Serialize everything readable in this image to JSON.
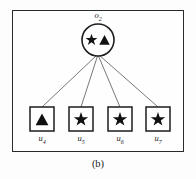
{
  "figure": {
    "caption": "(b)",
    "frame": {
      "visible": true,
      "stroke": "#2a2a2a"
    },
    "colors": {
      "stroke": "#2a2a2a",
      "edge": "#555555",
      "glyph_fill": "#111111",
      "background": "#fefefe"
    },
    "root": {
      "shape": "circle",
      "label_text": "o",
      "label_sub": "2",
      "center_x": 98,
      "center_y": 40,
      "radius": 16,
      "glyphs": [
        {
          "name": "star-glyph",
          "type": "star"
        },
        {
          "name": "triangle-glyph",
          "type": "triangle"
        }
      ]
    },
    "leaves": [
      {
        "label_text": "u",
        "label_sub": "4",
        "shape": "square",
        "glyph": "triangle",
        "x": 30,
        "y": 107,
        "size": 24
      },
      {
        "label_text": "u",
        "label_sub": "5",
        "shape": "square",
        "glyph": "star",
        "x": 69,
        "y": 107,
        "size": 24
      },
      {
        "label_text": "u",
        "label_sub": "6",
        "shape": "square",
        "glyph": "star",
        "x": 108,
        "y": 107,
        "size": 24
      },
      {
        "label_text": "u",
        "label_sub": "7",
        "shape": "square",
        "glyph": "star",
        "x": 146,
        "y": 107,
        "size": 24
      }
    ],
    "edges": [
      {
        "from": "o2",
        "to": "u4"
      },
      {
        "from": "o2",
        "to": "u5"
      },
      {
        "from": "o2",
        "to": "u6"
      },
      {
        "from": "o2",
        "to": "u7"
      }
    ]
  }
}
